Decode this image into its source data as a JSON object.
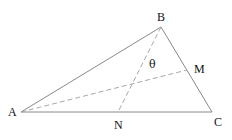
{
  "diagram": {
    "type": "geometry-triangle",
    "colors": {
      "solid_line": "#8a8a8a",
      "dashed_line": "#a8a8a8",
      "label": "#111111",
      "background": "#ffffff"
    },
    "points": {
      "A": {
        "label": "A",
        "x": 21,
        "y": 112,
        "label_x": 8,
        "label_y": 116
      },
      "B": {
        "label": "B",
        "x": 161,
        "y": 27,
        "label_x": 157,
        "label_y": 21
      },
      "C": {
        "label": "C",
        "x": 212,
        "y": 112,
        "label_x": 214,
        "label_y": 126
      },
      "M": {
        "label": "M",
        "x": 187,
        "y": 70,
        "label_x": 194,
        "label_y": 73
      },
      "N": {
        "label": "N",
        "x": 118,
        "y": 112,
        "label_x": 114,
        "label_y": 129
      }
    },
    "angle": {
      "label": "θ",
      "x": 149,
      "y": 68
    },
    "segments": {
      "solid": [
        [
          "A",
          "B"
        ],
        [
          "B",
          "C"
        ],
        [
          "A",
          "C"
        ]
      ],
      "dashed": [
        [
          "A",
          "M"
        ],
        [
          "B",
          "N"
        ]
      ]
    }
  }
}
